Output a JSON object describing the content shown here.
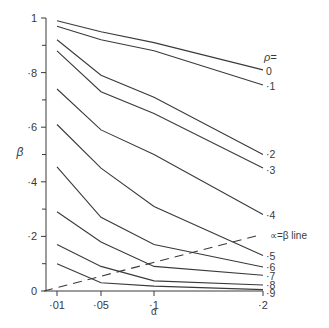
{
  "chart_data": {
    "type": "line",
    "title": "",
    "xlabel": "α",
    "ylabel": "β",
    "x": [
      0.01,
      0.05,
      0.1,
      0.2
    ],
    "x_tick_labels": [
      "·01",
      "·05",
      "·1",
      "·2"
    ],
    "y_ticks": [
      0,
      0.2,
      0.4,
      0.6,
      0.8,
      1.0
    ],
    "y_tick_labels": [
      "0",
      "·2",
      "·4",
      "·6",
      "·8",
      "1"
    ],
    "ylim": [
      0,
      1
    ],
    "grid": false,
    "legend_title": "ρ=",
    "legend_position": "right, labels at line ends",
    "series": [
      {
        "name": "0",
        "label": "0",
        "values": [
          0.99,
          0.95,
          0.91,
          0.81
        ]
      },
      {
        "name": "·1",
        "label": "·1",
        "values": [
          0.97,
          0.92,
          0.88,
          0.755
        ]
      },
      {
        "name": "·2",
        "label": "·2",
        "values": [
          0.92,
          0.79,
          0.71,
          0.5
        ]
      },
      {
        "name": "·3",
        "label": "·3",
        "values": [
          0.88,
          0.73,
          0.65,
          0.45
        ]
      },
      {
        "name": "·4",
        "label": "·4",
        "values": [
          0.74,
          0.59,
          0.5,
          0.28
        ]
      },
      {
        "name": "·5",
        "label": "·5",
        "values": [
          0.61,
          0.45,
          0.31,
          0.13
        ]
      },
      {
        "name": "·6",
        "label": "·6",
        "values": [
          0.455,
          0.27,
          0.17,
          0.088
        ]
      },
      {
        "name": "·7",
        "label": "·7",
        "values": [
          0.29,
          0.18,
          0.09,
          0.058
        ]
      },
      {
        "name": "·8",
        "label": "·8",
        "values": [
          0.17,
          0.09,
          0.037,
          0.022
        ]
      },
      {
        "name": "·9",
        "label": "·9",
        "values": [
          0.1,
          0.03,
          0.018,
          0.005
        ]
      }
    ],
    "reference_line": {
      "name": "α=β line",
      "label": "∝=β line",
      "style": "dashed",
      "from": [
        0,
        0
      ],
      "to": [
        0.2,
        0.2
      ]
    }
  },
  "layout": {
    "x_pixel": [
      57,
      101,
      154,
      263
    ],
    "origin_px": [
      46,
      291
    ],
    "y_top_px": 18,
    "x_end_px": 263,
    "color": "#3a3a3a"
  }
}
